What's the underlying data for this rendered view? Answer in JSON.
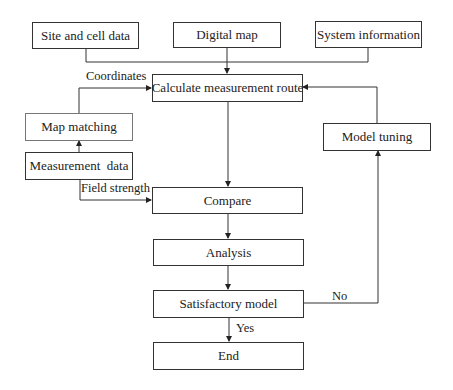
{
  "diagram": {
    "type": "flowchart",
    "nodes": {
      "site_cell": "Site and cell data",
      "digital_map": "Digital map",
      "system_info": "System information",
      "calc_route": "Calculate measurement route",
      "map_matching": "Map matching",
      "measurement_data": "Measurement  data",
      "model_tuning": "Model tuning",
      "compare": "Compare",
      "analysis": "Analysis",
      "satisfactory": "Satisfactory model",
      "end": "End"
    },
    "edge_labels": {
      "coordinates": "Coordinates",
      "field_strength": "Field strength",
      "no": "No",
      "yes": "Yes"
    },
    "edges": [
      {
        "from": "Site and cell data",
        "to": "Calculate measurement route"
      },
      {
        "from": "Digital map",
        "to": "Calculate measurement route"
      },
      {
        "from": "System information",
        "to": "Calculate measurement route"
      },
      {
        "from": "Measurement data",
        "to": "Map matching"
      },
      {
        "from": "Map matching",
        "to": "Calculate measurement route",
        "label": "Coordinates"
      },
      {
        "from": "Measurement data",
        "to": "Compare",
        "label": "Field strength"
      },
      {
        "from": "Calculate measurement route",
        "to": "Compare"
      },
      {
        "from": "Compare",
        "to": "Analysis"
      },
      {
        "from": "Analysis",
        "to": "Satisfactory model"
      },
      {
        "from": "Satisfactory model",
        "to": "End",
        "label": "Yes"
      },
      {
        "from": "Satisfactory model",
        "to": "Model tuning",
        "label": "No"
      },
      {
        "from": "Model tuning",
        "to": "Calculate measurement route"
      }
    ]
  }
}
